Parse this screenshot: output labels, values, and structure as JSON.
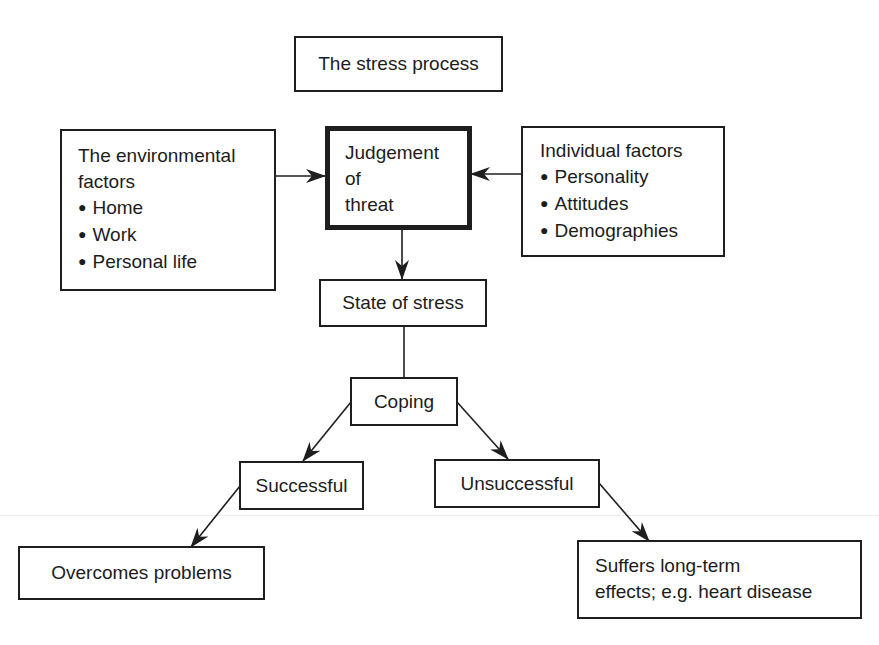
{
  "diagram": {
    "title": "The stress process",
    "environmental": {
      "heading_lines": [
        "The environmental",
        "factors"
      ],
      "items": [
        "Home",
        "Work",
        "Personal life"
      ]
    },
    "judgement": {
      "lines": [
        "Judgement",
        "of",
        "threat"
      ]
    },
    "individual": {
      "heading": "Individual factors",
      "items": [
        "Personality",
        "Attitudes",
        "Demographies"
      ]
    },
    "state": "State of stress",
    "coping": "Coping",
    "successful": "Successful",
    "unsuccessful": "Unsuccessful",
    "overcomes": "Overcomes problems",
    "suffers": {
      "lines": [
        "Suffers long-term",
        "effects; e.g. heart disease"
      ]
    },
    "edges": [
      {
        "from": "The environmental factors",
        "to": "Judgement of threat",
        "arrow": true
      },
      {
        "from": "Individual factors",
        "to": "Judgement of threat",
        "arrow": true
      },
      {
        "from": "Judgement of threat",
        "to": "State of stress",
        "arrow": true
      },
      {
        "from": "State of stress",
        "to": "Coping",
        "arrow": false
      },
      {
        "from": "Coping",
        "to": "Successful",
        "arrow": true
      },
      {
        "from": "Coping",
        "to": "Unsuccessful",
        "arrow": true
      },
      {
        "from": "Successful",
        "to": "Overcomes problems",
        "arrow": true
      },
      {
        "from": "Unsuccessful",
        "to": "Suffers long-term effects; e.g. heart disease",
        "arrow": true
      }
    ]
  }
}
